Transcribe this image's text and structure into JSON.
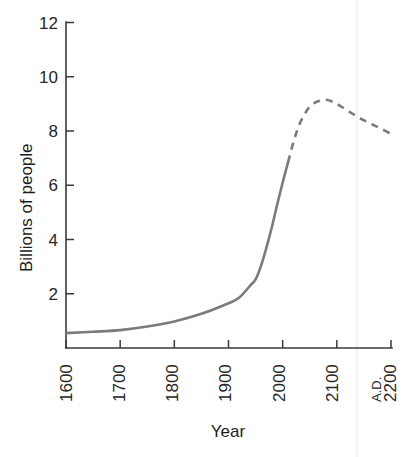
{
  "chart_data": {
    "type": "line",
    "title": "",
    "xlabel": "Year",
    "ylabel": "Billions of people",
    "xlim": [
      1600,
      2200
    ],
    "ylim": [
      0,
      12
    ],
    "grid": false,
    "legend": null,
    "x_tick_labels": [
      "1600",
      "1700",
      "1800",
      "1900",
      "2000",
      "2100",
      "2200"
    ],
    "x_tick_values": [
      1600,
      1700,
      1800,
      1900,
      2000,
      2100,
      2200
    ],
    "x_era_label": "A.D.",
    "y_tick_labels": [
      "2",
      "4",
      "6",
      "8",
      "10",
      "12"
    ],
    "y_tick_values": [
      2,
      4,
      6,
      8,
      10,
      12
    ],
    "series": [
      {
        "name": "Historical world population",
        "style": "solid",
        "color": "#7b7b7b",
        "x": [
          1600,
          1650,
          1700,
          1750,
          1800,
          1850,
          1900,
          1920,
          1940,
          1950,
          1960,
          1970,
          1980,
          1990,
          2000,
          2010
        ],
        "values": [
          0.55,
          0.6,
          0.66,
          0.79,
          0.98,
          1.26,
          1.65,
          1.86,
          2.3,
          2.53,
          3.03,
          3.7,
          4.45,
          5.3,
          6.1,
          6.85
        ]
      },
      {
        "name": "Projected world population",
        "style": "dashed",
        "color": "#7b7b7b",
        "x": [
          2010,
          2020,
          2030,
          2040,
          2050,
          2060,
          2070,
          2080,
          2090,
          2100,
          2120,
          2140,
          2160,
          2180,
          2200
        ],
        "values": [
          6.85,
          7.6,
          8.2,
          8.6,
          8.9,
          9.05,
          9.12,
          9.15,
          9.1,
          9.0,
          8.75,
          8.5,
          8.3,
          8.1,
          7.9
        ]
      }
    ],
    "annotations": []
  },
  "axis": {
    "y_title": "Billions of people",
    "x_title": "Year"
  }
}
